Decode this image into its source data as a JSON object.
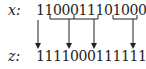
{
  "diagram": {
    "top_row": {
      "label": "x:",
      "bits": "1100011101000"
    },
    "bottom_row": {
      "label": "z:",
      "bits": "11110001111110"
    },
    "brackets": [
      {
        "over": "000",
        "start_index": 2,
        "end_index": 4
      },
      {
        "over": "111",
        "start_index": 5,
        "end_index": 7
      },
      {
        "over": "000",
        "start_index": 10,
        "end_index": 12
      }
    ],
    "arrows": [
      {
        "from": "bit 1 of x",
        "x": 38
      },
      {
        "from": "bracket 1",
        "x": 69
      },
      {
        "from": "bracket 2",
        "x": 94
      },
      {
        "from": "bracket 3",
        "x": 133
      }
    ],
    "stroke_color": "#222222"
  }
}
